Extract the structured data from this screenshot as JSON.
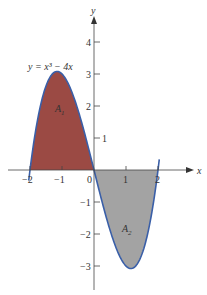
{
  "chart_data": {
    "type": "area",
    "title": "",
    "function_label": "y = x³ − 4x",
    "function": "x^3 - 4x",
    "xlabel": "x",
    "ylabel": "y",
    "xlim": [
      -2.7,
      3.1
    ],
    "ylim": [
      -3.6,
      5.0
    ],
    "x_ticks": [
      -2,
      -1,
      0,
      1,
      2
    ],
    "x_tick_labels": [
      "−2",
      "−1",
      "0",
      "1",
      "2"
    ],
    "y_ticks": [
      -3,
      -2,
      -1,
      1,
      2,
      3,
      4
    ],
    "y_tick_labels": [
      "−3",
      "−2",
      "−1",
      "1",
      "2",
      "3",
      "4"
    ],
    "grid": false,
    "regions": [
      {
        "name": "A1",
        "label": "A",
        "subscript": "1",
        "x_range": [
          -2,
          0
        ],
        "color": "#9b4a44"
      },
      {
        "name": "A2",
        "label": "A",
        "subscript": "2",
        "x_range": [
          0,
          2
        ],
        "color": "#a3a3a3"
      }
    ],
    "curve_color": "#3a5fa8",
    "key_points": [
      {
        "x": -2,
        "y": 0
      },
      {
        "x": -1.155,
        "y": 3.08
      },
      {
        "x": 0,
        "y": 0
      },
      {
        "x": 1.155,
        "y": -3.08
      },
      {
        "x": 2,
        "y": 0
      }
    ]
  }
}
